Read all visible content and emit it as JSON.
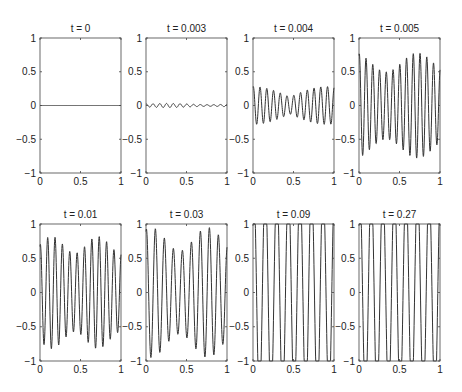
{
  "chart_data": {
    "type": "line",
    "layout": {
      "rows": 2,
      "cols": 4
    },
    "xlim": [
      0,
      1
    ],
    "ylim": [
      -1,
      1
    ],
    "xticks": [
      0,
      0.5,
      1
    ],
    "xtick_labels": [
      "0",
      "0.5",
      "1"
    ],
    "yticks": [
      -1,
      -0.5,
      0,
      0.5,
      1
    ],
    "ytick_labels": [
      "−1",
      "−0.5",
      "0",
      "0.5",
      "1"
    ],
    "grid": false,
    "legend": null,
    "line_color": "#333333",
    "panels": [
      {
        "title": "t = 0",
        "description": "flat line at u = 0",
        "amplitude": 0.0,
        "oscillations": 0
      },
      {
        "title": "t = 0.003",
        "description": "small-amplitude ripple around 0",
        "amplitude": 0.03,
        "oscillations": 12
      },
      {
        "title": "t = 0.004",
        "description": "growing oscillations, amplitude ~0.1-0.28",
        "amplitude": 0.28,
        "oscillations": 12
      },
      {
        "title": "t = 0.005",
        "description": "large oscillations, amplitude ~0.6-0.8",
        "amplitude": 0.78,
        "oscillations": 12
      },
      {
        "title": "t = 0.01",
        "description": "oscillations ~0.55-0.85 with irregular merging near x=0.35",
        "amplitude": 0.82,
        "oscillations": 11
      },
      {
        "title": "t = 0.03",
        "description": "coarsening oscillations, amplitude ~0.7-0.97",
        "amplitude": 0.95,
        "oscillations": 9
      },
      {
        "title": "t = 0.09",
        "description": "saturated square-like waves at ±1",
        "amplitude": 1.0,
        "oscillations": 7
      },
      {
        "title": "t = 0.27",
        "description": "saturated waves at ±1",
        "amplitude": 1.0,
        "oscillations": 7
      }
    ]
  }
}
